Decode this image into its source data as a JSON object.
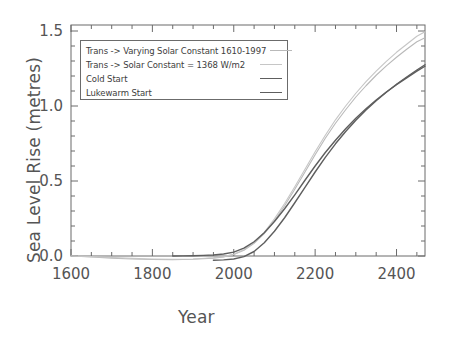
{
  "chart_data": {
    "type": "line",
    "title": "",
    "xlabel": "Year",
    "ylabel": "Sea Level Rise (metres)",
    "xlim": [
      1600,
      2470
    ],
    "ylim": [
      -0.08,
      1.58
    ],
    "xticks": [
      1600,
      1800,
      2000,
      2200,
      2400
    ],
    "xtick_labels": [
      "1600",
      "1800",
      "2000",
      "2200",
      "2400"
    ],
    "yticks": [
      0.0,
      0.5,
      1.0,
      1.5
    ],
    "ytick_labels": [
      "0.0",
      "0.5",
      "1.0",
      "1.5"
    ],
    "xminor_step": 50,
    "yminor_step": 0.1,
    "grid": false,
    "legend_position": "upper-left",
    "series": [
      {
        "name": "Trans -> Varying Solar Constant 1610-1997",
        "color": "#b9b9b9",
        "width": 1.1,
        "x": [
          1600,
          1650,
          1700,
          1750,
          1800,
          1850,
          1900,
          1950,
          1975,
          2000,
          2025,
          2050,
          2075,
          2100,
          2125,
          2150,
          2175,
          2200,
          2225,
          2250,
          2275,
          2300,
          2325,
          2350,
          2375,
          2400,
          2425,
          2450,
          2470
        ],
        "y": [
          0.0,
          -0.006,
          -0.014,
          -0.02,
          -0.023,
          -0.024,
          -0.022,
          -0.014,
          -0.006,
          0.01,
          0.038,
          0.085,
          0.15,
          0.235,
          0.335,
          0.445,
          0.56,
          0.675,
          0.785,
          0.885,
          0.975,
          1.06,
          1.135,
          1.205,
          1.268,
          1.325,
          1.378,
          1.428,
          1.455
        ]
      },
      {
        "name": "Trans -> Solar Constant = 1368 W/m^2",
        "color": "#c6c6c6",
        "width": 1.1,
        "x": [
          1600,
          1650,
          1700,
          1750,
          1800,
          1850,
          1900,
          1950,
          1975,
          2000,
          2025,
          2050,
          2075,
          2100,
          2125,
          2150,
          2175,
          2200,
          2225,
          2250,
          2275,
          2300,
          2325,
          2350,
          2375,
          2400,
          2425,
          2450,
          2470
        ],
        "y": [
          0.0,
          -0.004,
          -0.01,
          -0.016,
          -0.02,
          -0.022,
          -0.02,
          -0.012,
          -0.004,
          0.012,
          0.042,
          0.092,
          0.158,
          0.248,
          0.35,
          0.462,
          0.578,
          0.695,
          0.805,
          0.908,
          1.0,
          1.085,
          1.162,
          1.232,
          1.298,
          1.358,
          1.412,
          1.465,
          1.495
        ]
      },
      {
        "name": "Cold Start",
        "color": "#5e5e5e",
        "width": 1.4,
        "x": [
          1850,
          1875,
          1900,
          1925,
          1950,
          1975,
          2000,
          2025,
          2050,
          2075,
          2100,
          2125,
          2150,
          2175,
          2200,
          2225,
          2250,
          2275,
          2300,
          2325,
          2350,
          2375,
          2400,
          2425,
          2450,
          2470
        ],
        "y": [
          0.0,
          0.001,
          0.002,
          0.004,
          0.007,
          0.013,
          0.026,
          0.052,
          0.095,
          0.155,
          0.23,
          0.315,
          0.408,
          0.505,
          0.6,
          0.69,
          0.772,
          0.848,
          0.918,
          0.982,
          1.04,
          1.093,
          1.142,
          1.188,
          1.232,
          1.265
        ]
      },
      {
        "name": "Lukewarm Start",
        "color": "#5e5e5e",
        "width": 1.4,
        "x": [
          1950,
          1975,
          2000,
          2025,
          2050,
          2075,
          2100,
          2125,
          2150,
          2175,
          2200,
          2225,
          2250,
          2275,
          2300,
          2325,
          2350,
          2375,
          2400,
          2425,
          2450,
          2470
        ],
        "y": [
          -0.028,
          -0.026,
          -0.02,
          -0.004,
          0.03,
          0.088,
          0.165,
          0.255,
          0.355,
          0.458,
          0.56,
          0.658,
          0.748,
          0.83,
          0.905,
          0.973,
          1.035,
          1.092,
          1.145,
          1.193,
          1.24,
          1.275
        ]
      }
    ]
  },
  "legend": {
    "items": [
      {
        "label": "Trans -> Varying Solar Constant 1610-1997"
      },
      {
        "label": "Trans -> Solar Constant = 1368 W/m2"
      },
      {
        "label": "Cold Start"
      },
      {
        "label": "Lukewarm Start"
      }
    ]
  },
  "axes": {
    "x_title": "Year",
    "y_title": "Sea Level Rise (metres)"
  },
  "colors": {
    "axis": "#6b6b6b",
    "text": "#555555",
    "series_light_a": "#b9b9b9",
    "series_light_b": "#c6c6c6",
    "series_dark": "#5e5e5e",
    "background": "#ffffff"
  }
}
